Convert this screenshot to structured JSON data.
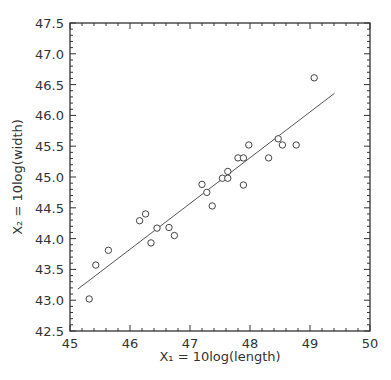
{
  "chart_data": {
    "type": "scatter",
    "title": "",
    "xlabel": "X₁ = 10log(length)",
    "ylabel": "X₂ = 10log(width)",
    "xlim": [
      45,
      50
    ],
    "ylim": [
      42.5,
      47.5
    ],
    "x_ticks": [
      45,
      46,
      47,
      48,
      49,
      50
    ],
    "x_tick_labels": [
      "45",
      "46",
      "47",
      "48",
      "49",
      "50"
    ],
    "y_ticks": [
      42.5,
      43.0,
      43.5,
      44.0,
      44.5,
      45.0,
      45.5,
      46.0,
      46.5,
      47.0,
      47.5
    ],
    "y_tick_labels": [
      "42.5",
      "43.0",
      "43.5",
      "44.0",
      "44.5",
      "45.0",
      "45.5",
      "46.0",
      "46.5",
      "47.0",
      "47.5"
    ],
    "x_minor_step": 0.2,
    "y_minor_step": 0.1,
    "grid": false,
    "legend": null,
    "marker": "open-circle",
    "series": [
      {
        "name": "observations",
        "points": [
          [
            45.32,
            43.02
          ],
          [
            45.43,
            43.57
          ],
          [
            45.64,
            43.81
          ],
          [
            46.16,
            44.29
          ],
          [
            46.26,
            44.4
          ],
          [
            46.35,
            43.93
          ],
          [
            46.45,
            44.17
          ],
          [
            46.65,
            44.18
          ],
          [
            46.74,
            44.05
          ],
          [
            47.2,
            44.88
          ],
          [
            47.28,
            44.75
          ],
          [
            47.37,
            44.53
          ],
          [
            47.54,
            44.98
          ],
          [
            47.63,
            45.09
          ],
          [
            47.63,
            44.98
          ],
          [
            47.8,
            45.31
          ],
          [
            47.89,
            45.31
          ],
          [
            47.89,
            44.87
          ],
          [
            47.98,
            45.52
          ],
          [
            48.31,
            45.31
          ],
          [
            48.47,
            45.62
          ],
          [
            48.54,
            45.52
          ],
          [
            48.77,
            45.52
          ],
          [
            49.07,
            46.61
          ]
        ]
      }
    ],
    "fit_line": {
      "name": "regression line",
      "from": [
        45.13,
        43.18
      ],
      "to": [
        49.41,
        46.36
      ]
    }
  },
  "colors": {
    "axis": "#333333",
    "marker": "#444444",
    "line": "#555555",
    "background": "#ffffff"
  }
}
